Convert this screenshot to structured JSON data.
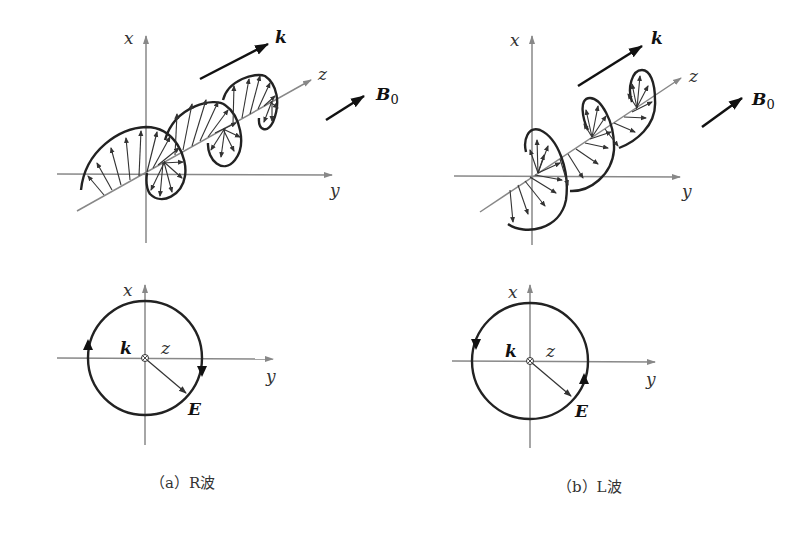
{
  "panels": [
    {
      "id": "a",
      "caption": "（a）R波",
      "helix_labels": {
        "x": "x",
        "y": "y",
        "z": "z",
        "k": "k",
        "b0": "B",
        "b0_sub": "0"
      },
      "circle_labels": {
        "x": "x",
        "y": "y",
        "z": "z",
        "k": "k",
        "e": "E"
      },
      "rotation": "clockwise"
    },
    {
      "id": "b",
      "caption": "（b）L波",
      "helix_labels": {
        "x": "x",
        "y": "y",
        "z": "z",
        "k": "k",
        "b0": "B",
        "b0_sub": "0"
      },
      "circle_labels": {
        "x": "x",
        "y": "y",
        "z": "z",
        "k": "k",
        "e": "E"
      },
      "rotation": "counterclockwise"
    }
  ],
  "colors": {
    "axis": "#888888",
    "curve": "#222222",
    "arrow": "#333333"
  }
}
